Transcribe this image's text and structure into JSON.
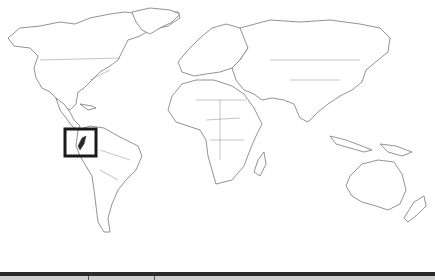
{
  "figure": {
    "type": "world-map-locator",
    "highlighted_region": "Ecuador",
    "highlight_box": {
      "x": 64,
      "y": 128,
      "width": 33,
      "height": 29
    },
    "colors": {
      "background": "#ffffff",
      "coastline": "#777777",
      "highlight": "#1a1a1a",
      "footer_bar": "#2b2b2b",
      "footer_band": "#cfcfcf"
    }
  }
}
